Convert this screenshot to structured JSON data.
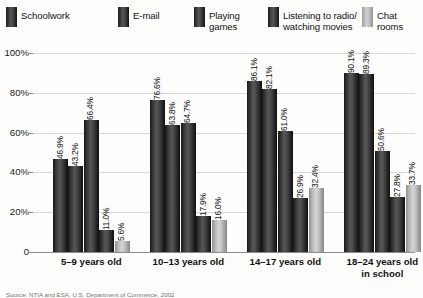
{
  "legend": {
    "items": [
      {
        "label": "Schoolwork",
        "color": "#2f2f2f",
        "style": "dark"
      },
      {
        "label": "E-mail",
        "color": "#2f2f2f",
        "style": "dark"
      },
      {
        "label": "Playing\ngames",
        "color": "#2f2f2f",
        "style": "dark"
      },
      {
        "label": "Listening to radio/\nwatching movies",
        "color": "#2f2f2f",
        "style": "dark"
      },
      {
        "label": "Chat rooms",
        "color": "#c2c2c2",
        "style": "light"
      }
    ]
  },
  "axis": {
    "y_ticks": [
      "100%",
      "80%",
      "60%",
      "40%",
      "20%",
      "0"
    ],
    "y_values": [
      100,
      80,
      60,
      40,
      20,
      0
    ]
  },
  "source": "Source: NTIA and ESA, U.S. Department of Commerce, 2002",
  "chart_data": {
    "type": "bar",
    "title": "",
    "xlabel": "",
    "ylabel": "",
    "ylim": [
      0,
      100
    ],
    "grid": true,
    "legend_position": "top",
    "categories": [
      "5–9 years old",
      "10–13 years old",
      "14–17 years old",
      "18–24 years old\nin school"
    ],
    "series": [
      {
        "name": "Schoolwork",
        "values": [
          46.9,
          76.6,
          86.1,
          90.1
        ],
        "labels": [
          "46.9%",
          "76.6%",
          "86.1%",
          "90.1%"
        ]
      },
      {
        "name": "E-mail",
        "values": [
          43.2,
          63.8,
          82.1,
          89.3
        ],
        "labels": [
          "43.2%",
          "63.8%",
          "82.1%",
          "89.3%"
        ]
      },
      {
        "name": "Playing games",
        "values": [
          66.4,
          64.7,
          61.0,
          50.6
        ],
        "labels": [
          "66.4%",
          "64.7%",
          "61.0%",
          "50.6%"
        ]
      },
      {
        "name": "Listening to radio/watching movies",
        "values": [
          11.0,
          17.9,
          26.9,
          27.8
        ],
        "labels": [
          "11.0%",
          "17.9%",
          "26.9%",
          "27.8%"
        ]
      },
      {
        "name": "Chat rooms",
        "values": [
          5.6,
          16.0,
          32.4,
          33.7
        ],
        "labels": [
          "5.6%",
          "16.0%",
          "32.4%",
          "33.7%"
        ]
      }
    ]
  }
}
